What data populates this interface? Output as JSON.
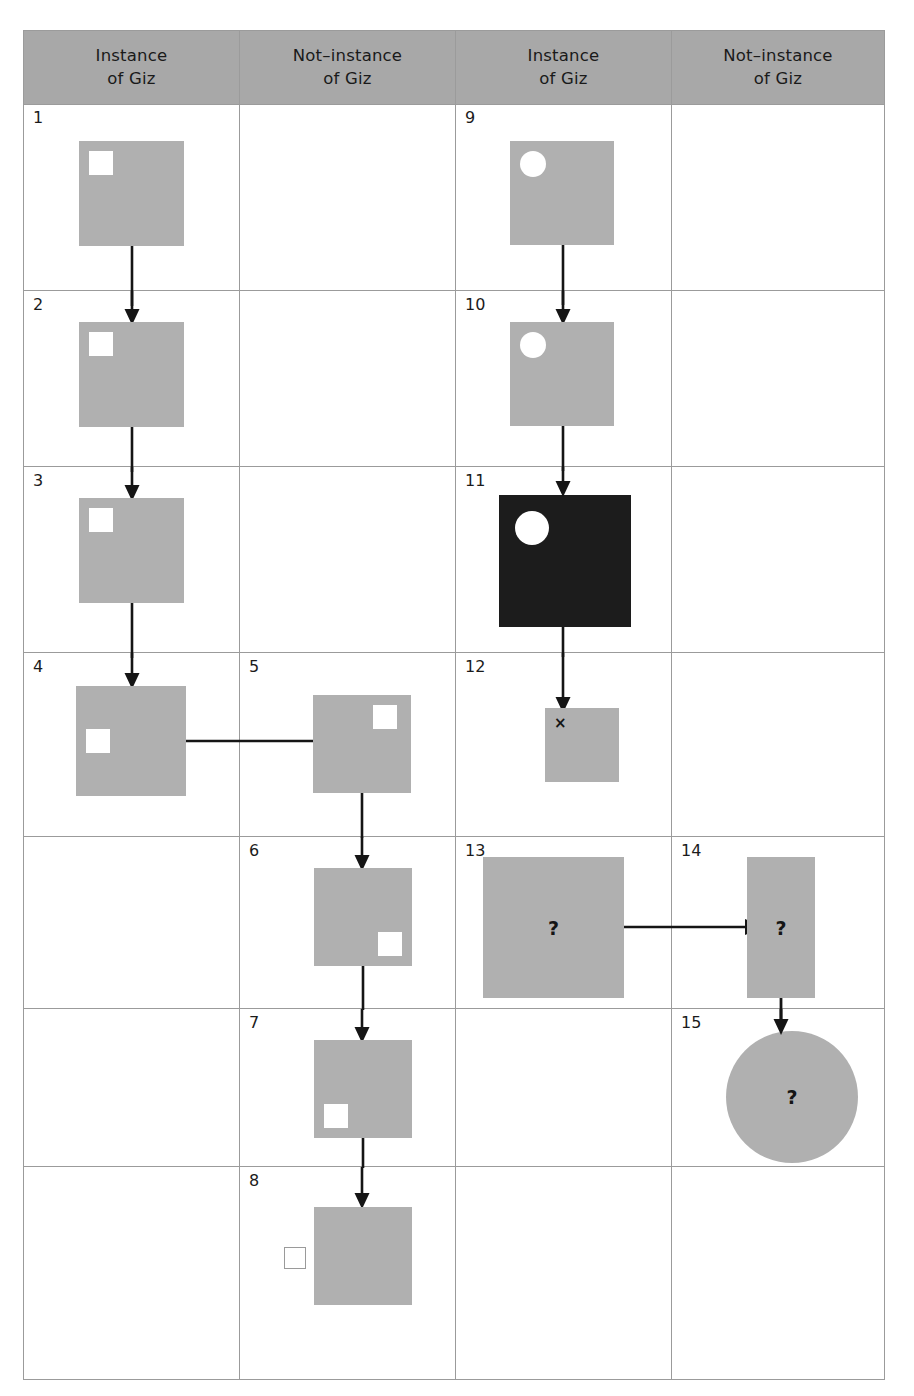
{
  "figure": {
    "type": "concept-grid",
    "columns": [
      {
        "id": "c1",
        "line1": "Instance",
        "line2": "of Giz"
      },
      {
        "id": "c2",
        "line1": "Not–instance",
        "line2": "of Giz"
      },
      {
        "id": "c3",
        "line1": "Instance",
        "line2": "of Giz"
      },
      {
        "id": "c4",
        "line1": "Not–instance",
        "line2": "of Giz"
      }
    ],
    "colors": {
      "header_fill": "#a8a8a8",
      "grid_line": "#9b9b9b",
      "shape_fill": "#b0b0b0",
      "shape_dark_fill": "#1c1c1c",
      "marker_fill": "#ffffff",
      "marker_outline": "#9a9a9a",
      "ink": "#151515",
      "background": "#ffffff"
    },
    "panels": [
      {
        "number": "1",
        "column": 1,
        "row": 1,
        "shape": "square",
        "marker": "square-white",
        "marker_position": "top-left",
        "label": ""
      },
      {
        "number": "2",
        "column": 1,
        "row": 2,
        "shape": "square",
        "marker": "square-white",
        "marker_position": "top-left",
        "label": ""
      },
      {
        "number": "3",
        "column": 1,
        "row": 3,
        "shape": "square",
        "marker": "square-white",
        "marker_position": "top-left",
        "label": ""
      },
      {
        "number": "4",
        "column": 1,
        "row": 4,
        "shape": "square",
        "marker": "square-white",
        "marker_position": "middle-left",
        "label": ""
      },
      {
        "number": "5",
        "column": 2,
        "row": 4,
        "shape": "square",
        "marker": "square-white",
        "marker_position": "top-right",
        "label": ""
      },
      {
        "number": "6",
        "column": 2,
        "row": 5,
        "shape": "square",
        "marker": "square-white",
        "marker_position": "bottom-right",
        "label": ""
      },
      {
        "number": "7",
        "column": 2,
        "row": 6,
        "shape": "square",
        "marker": "square-white",
        "marker_position": "bottom-left",
        "label": ""
      },
      {
        "number": "8",
        "column": 2,
        "row": 7,
        "shape": "square",
        "marker": "square-outline",
        "marker_position": "outside-left",
        "label": ""
      },
      {
        "number": "9",
        "column": 3,
        "row": 1,
        "shape": "square",
        "marker": "circle-white",
        "marker_position": "top-left",
        "label": ""
      },
      {
        "number": "10",
        "column": 3,
        "row": 2,
        "shape": "square",
        "marker": "circle-white",
        "marker_position": "top-left",
        "label": ""
      },
      {
        "number": "11",
        "column": 3,
        "row": 3,
        "shape": "square-dark",
        "marker": "circle-white",
        "marker_position": "top-left",
        "label": ""
      },
      {
        "number": "12",
        "column": 3,
        "row": 4,
        "shape": "square-small",
        "marker": "x-mark",
        "marker_position": "top-left",
        "label": "×"
      },
      {
        "number": "13",
        "column": 3,
        "row": 5,
        "shape": "square-large",
        "marker": "none",
        "marker_position": "",
        "label": "?"
      },
      {
        "number": "14",
        "column": 4,
        "row": 5,
        "shape": "rectangle-tall",
        "marker": "none",
        "marker_position": "",
        "label": "?"
      },
      {
        "number": "15",
        "column": 4,
        "row": 6,
        "shape": "circle-large",
        "marker": "none",
        "marker_position": "",
        "label": "?"
      }
    ],
    "arrows": [
      {
        "from": "1",
        "to": "2",
        "direction": "down"
      },
      {
        "from": "2",
        "to": "3",
        "direction": "down"
      },
      {
        "from": "3",
        "to": "4",
        "direction": "down"
      },
      {
        "from": "4",
        "to": "5",
        "direction": "right"
      },
      {
        "from": "5",
        "to": "6",
        "direction": "down"
      },
      {
        "from": "6",
        "to": "7",
        "direction": "down"
      },
      {
        "from": "7",
        "to": "8",
        "direction": "down"
      },
      {
        "from": "9",
        "to": "10",
        "direction": "down"
      },
      {
        "from": "10",
        "to": "11",
        "direction": "down"
      },
      {
        "from": "11",
        "to": "12",
        "direction": "down"
      },
      {
        "from": "13",
        "to": "14",
        "direction": "right"
      },
      {
        "from": "14",
        "to": "15",
        "direction": "down"
      }
    ]
  }
}
